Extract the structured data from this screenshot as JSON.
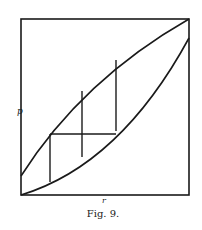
{
  "figure": {
    "caption": "Fig. 9.",
    "y_axis_label": "p",
    "x_axis_label": "r",
    "line_color": "#1a1a1a",
    "background": "#ffffff",
    "box": {
      "left": 21,
      "top": 19,
      "right": 189,
      "bottom": 195
    },
    "upper_curve": {
      "description": "concave curve from lower-left (on left edge above origin) to top-right corner",
      "path": "M21,176 Q82,80 189,19"
    },
    "lower_curve": {
      "description": "convex curve from origin (bottom-left corner) to right edge below top-right corner",
      "path": "M21,195 Q120,165 189,38"
    },
    "staircase": {
      "verticals": [
        {
          "x": 50,
          "y1": 134,
          "y2": 182
        },
        {
          "x": 82,
          "y1": 91,
          "y2": 157
        },
        {
          "x": 116,
          "y1": 60,
          "y2": 131
        }
      ],
      "horizontals": [
        {
          "y": 134,
          "x1": 50,
          "x2": 116
        }
      ]
    }
  }
}
